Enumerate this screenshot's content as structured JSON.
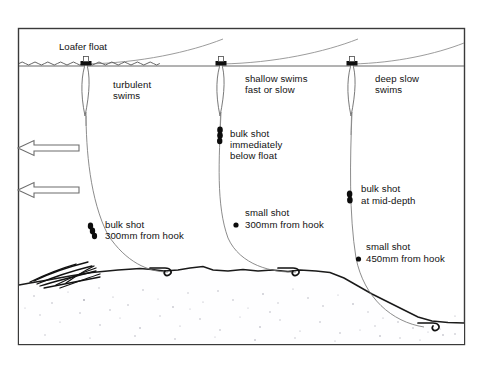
{
  "figure": {
    "kind": "fishing-rig-diagram",
    "title_label": "Loafer float",
    "frame": {
      "x": 18,
      "y": 28,
      "width": 447,
      "height": 317
    }
  },
  "colors": {
    "ink": "#111111",
    "line_gray": "#8a8a8a",
    "frame": "#3a3a3a",
    "bed": "#1a1a1a",
    "shot": "#0c0c0c",
    "paper": "#ffffff"
  },
  "callouts": {
    "loafer_float": "Loafer float",
    "swim_left_line1": "turbulent",
    "swim_left_line2": "swims",
    "swim_mid_line1": "shallow swims",
    "swim_mid_line2": "fast or slow",
    "swim_right_line1": "deep slow",
    "swim_right_line2": "swims",
    "bulk_below_float_line1": "bulk shot",
    "bulk_below_float_line2": "immediately",
    "bulk_below_float_line3": "below float",
    "bulk_mid_depth_line1": "bulk shot",
    "bulk_mid_depth_line2": "at mid-depth",
    "bulk_300_line1": "bulk shot",
    "bulk_300_line2": "300mm from hook",
    "small_300_line1": "small shot",
    "small_300_line2": "300mm from hook",
    "small_450_line1": "small shot",
    "small_450_line2": "450mm from hook"
  },
  "rigs": [
    {
      "id": "rig-left",
      "swim_label": "turbulent swims",
      "float_x": 86,
      "shot_type": "bulk",
      "shot_note": "bulk shot 300mm from hook",
      "distance_from_hook": "300mm"
    },
    {
      "id": "rig-middle",
      "swim_label": "shallow swims fast or slow",
      "float_x": 221,
      "shot_type": "bulk + small",
      "shot_note": "bulk shot immediately below float; small shot 300mm from hook",
      "distance_from_hook": "300mm"
    },
    {
      "id": "rig-right",
      "swim_label": "deep slow swims",
      "float_x": 352,
      "shot_type": "bulk + small",
      "shot_note": "bulk shot at mid-depth; small shot 450mm from hook",
      "distance_from_hook": "450mm"
    }
  ],
  "flow": {
    "arrow_count": 2,
    "direction": "left",
    "icon": "current-arrow-icon"
  },
  "icons": {
    "float": "loafer-float-icon",
    "shot": "split-shot-icon",
    "hook": "fish-hook-icon",
    "weed": "riverbed-weed-icon",
    "arrow": "flow-arrow-icon"
  }
}
